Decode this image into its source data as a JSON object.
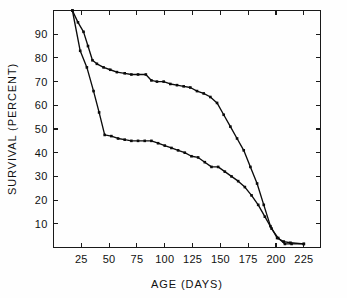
{
  "figure": {
    "background_color": "#fefefe",
    "foreground_color": "#0b0b0b"
  },
  "chart_data": {
    "type": "line",
    "title": "",
    "subtitle": "",
    "xlabel": "AGE  (DAYS)",
    "ylabel": "SURVIVAL  (PERCENT)",
    "xlim": [
      0,
      240
    ],
    "ylim": [
      0,
      100
    ],
    "xticks": [
      25,
      50,
      75,
      100,
      125,
      150,
      175,
      200,
      225
    ],
    "xtick_labels": [
      "25",
      "50",
      "75",
      "100",
      "125",
      "150",
      "175",
      "200",
      "225"
    ],
    "yticks": [
      10,
      20,
      30,
      40,
      50,
      60,
      70,
      80,
      90
    ],
    "ytick_labels": [
      "10",
      "20",
      "30",
      "40",
      "50",
      "60",
      "70",
      "80",
      "90"
    ],
    "grid": false,
    "legend": false,
    "legend_position": "none",
    "marker": "square",
    "line_color": "#0b0b0b",
    "series": [
      {
        "name": "upper-survival-curve",
        "color": "#0b0b0b",
        "x": [
          17,
          22,
          27,
          31,
          35,
          39,
          45,
          51,
          57,
          64,
          70,
          76,
          83,
          88,
          93,
          99,
          105,
          111,
          117,
          123,
          129,
          135,
          141,
          147,
          153,
          159,
          165,
          171,
          177,
          183,
          189,
          195,
          201,
          207,
          213,
          225
        ],
        "y": [
          100,
          95,
          91,
          85,
          79,
          77.5,
          76,
          75,
          74,
          73.5,
          73,
          73,
          73,
          70.5,
          70,
          70,
          69,
          68.5,
          68,
          67.5,
          66,
          65,
          63.5,
          61,
          56,
          51,
          46,
          41,
          34,
          27,
          18,
          9,
          4,
          2.5,
          2,
          1.5
        ]
      },
      {
        "name": "lower-survival-curve",
        "color": "#0b0b0b",
        "x": [
          17,
          24,
          30,
          36,
          41,
          46,
          52,
          58,
          64,
          70,
          76,
          82,
          88,
          94,
          100,
          106,
          112,
          118,
          124,
          130,
          136,
          142,
          148,
          154,
          160,
          166,
          172,
          178,
          184,
          190,
          196,
          202,
          208,
          214,
          225
        ],
        "y": [
          100,
          83,
          76,
          66,
          57,
          47.5,
          47,
          46,
          45.5,
          45,
          45,
          45,
          45,
          44,
          43,
          42,
          41,
          40,
          38.5,
          38,
          36,
          34,
          34,
          32,
          30,
          28,
          25.5,
          22,
          18,
          13,
          8,
          4,
          1.5,
          1.5,
          1.5
        ]
      }
    ]
  }
}
